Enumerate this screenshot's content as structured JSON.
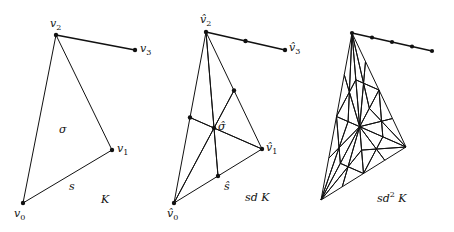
{
  "figures": [
    {
      "id": "K",
      "caption": "K",
      "vertices": {
        "v0": {
          "x": 23,
          "y": 203,
          "label": "v",
          "sub": "0",
          "lx": 14,
          "ly": 208
        },
        "v1": {
          "x": 112,
          "y": 150,
          "label": "v",
          "sub": "1",
          "lx": 117,
          "ly": 143
        },
        "v2": {
          "x": 56,
          "y": 35,
          "label": "v",
          "sub": "2",
          "lx": 50,
          "ly": 18
        },
        "v3": {
          "x": 135,
          "y": 50,
          "label": "v",
          "sub": "3",
          "lx": 140,
          "ly": 43
        }
      },
      "face_label": {
        "text": "σ",
        "x": 59,
        "y": 124
      },
      "edge_label": {
        "text": "s",
        "x": 69,
        "y": 181
      },
      "caption_pos": {
        "x": 101,
        "y": 194
      }
    },
    {
      "id": "sdK",
      "caption": "sd K",
      "vertices": {
        "v0": {
          "x": 174,
          "y": 203,
          "label": "v̂",
          "sub": "0",
          "lx": 167,
          "ly": 208
        },
        "v1": {
          "x": 262,
          "y": 149,
          "label": "v̂",
          "sub": "1",
          "lx": 266,
          "ly": 142
        },
        "v2": {
          "x": 206,
          "y": 32,
          "label": "v̂",
          "sub": "2",
          "lx": 200,
          "ly": 14
        },
        "v3": {
          "x": 285,
          "y": 50,
          "label": "v̂",
          "sub": "3",
          "lx": 289,
          "ly": 42
        }
      },
      "face_label": {
        "text": "σ̂",
        "x": 218,
        "y": 121
      },
      "edge_label": {
        "text": "ŝ",
        "x": 224,
        "y": 181
      },
      "caption_pos": {
        "x": 245,
        "y": 192
      }
    },
    {
      "id": "sd2K",
      "caption": "sd",
      "caption_sup": "2",
      "caption_tail": "K",
      "vertices": {
        "v0": {
          "x": 321,
          "y": 200
        },
        "v1": {
          "x": 406,
          "y": 147
        },
        "v2": {
          "x": 352,
          "y": 33
        },
        "v3": {
          "x": 432,
          "y": 51
        }
      },
      "caption_pos": {
        "x": 377,
        "y": 191
      }
    }
  ]
}
